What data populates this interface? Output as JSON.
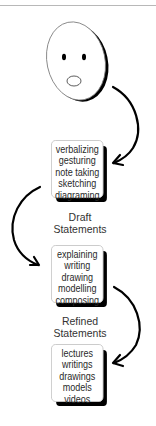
{
  "diagram": {
    "colors": {
      "stroke": "#000000",
      "box_border": "#c8c8c8",
      "text": "#2a2a2a",
      "background": "#ffffff"
    },
    "face": {
      "icon": "surprised-face-icon",
      "expression": "surprised"
    },
    "boxes": [
      {
        "id": "box-1",
        "items": [
          "verbalizing",
          "gesturing",
          "note taking",
          "sketching",
          "diagraming"
        ]
      },
      {
        "id": "box-2",
        "items": [
          "explaining",
          "writing",
          "drawing",
          "modelling",
          "composing"
        ]
      },
      {
        "id": "box-3",
        "items": [
          "lectures",
          "writings",
          "drawings",
          "models",
          "videos"
        ]
      }
    ],
    "labels": [
      {
        "lines": [
          "Draft",
          "Statements"
        ]
      },
      {
        "lines": [
          "Refined",
          "Statements"
        ]
      }
    ],
    "arrows": [
      {
        "from": "face",
        "to": "box-1",
        "side": "right"
      },
      {
        "from": "box-1",
        "to": "box-2",
        "side": "left"
      },
      {
        "from": "box-2",
        "to": "box-3",
        "side": "right"
      }
    ]
  }
}
